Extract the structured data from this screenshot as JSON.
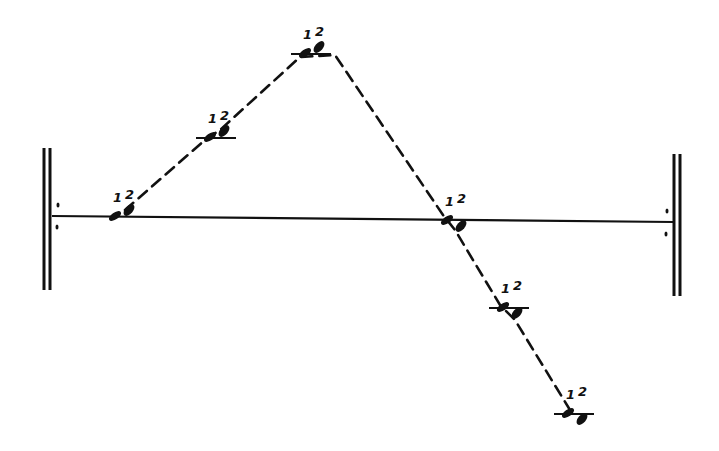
{
  "diagram": {
    "type": "string-between-walls",
    "colors": {
      "ink": "#111111",
      "background": "#ffffff"
    },
    "walls": [
      {
        "id": "left-wall",
        "x": 47,
        "y_top": 148,
        "y_bottom": 290
      },
      {
        "id": "right-wall",
        "x": 677,
        "y_top": 154,
        "y_bottom": 296
      }
    ],
    "baseline": {
      "x1": 52,
      "y1": 216,
      "x2": 673,
      "y2": 222
    },
    "wall_dots": [
      {
        "x": 58,
        "y": 205
      },
      {
        "x": 57,
        "y": 227
      },
      {
        "x": 667,
        "y": 211
      },
      {
        "x": 666,
        "y": 234
      }
    ],
    "points": [
      {
        "id": "p1",
        "x": 115,
        "y": 216,
        "label_1": "1",
        "label_2": "2",
        "tick": false
      },
      {
        "id": "p2",
        "x": 210,
        "y": 137,
        "label_1": "1",
        "label_2": "2",
        "tick": true
      },
      {
        "id": "p3",
        "x": 305,
        "y": 53,
        "label_1": "1",
        "label_2": "2",
        "tick": true
      },
      {
        "id": "p4",
        "x": 447,
        "y": 220,
        "label_1": "1",
        "label_2": "2",
        "tick": false
      },
      {
        "id": "p5",
        "x": 503,
        "y": 307,
        "label_1": "1",
        "label_2": "2",
        "tick": true
      },
      {
        "id": "p6",
        "x": 568,
        "y": 413,
        "label_1": "1",
        "label_2": "2",
        "tick": true
      }
    ],
    "dashed_path": [
      [
        125,
        210
      ],
      [
        205,
        140
      ],
      [
        220,
        130
      ],
      [
        300,
        57
      ],
      [
        335,
        55
      ],
      [
        443,
        215
      ],
      [
        455,
        230
      ],
      [
        500,
        305
      ],
      [
        515,
        320
      ],
      [
        570,
        410
      ]
    ]
  }
}
